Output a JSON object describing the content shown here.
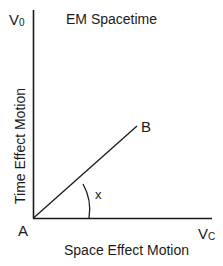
{
  "diagram": {
    "title": "EM Spacetime",
    "axes": {
      "y_end_label": "V",
      "y_end_subscript": "0",
      "x_end_label": "V",
      "x_end_subscript": "C",
      "y_axis_title": "Time Effect Motion",
      "x_axis_title": "Space Effect Motion"
    },
    "points": {
      "origin": "A",
      "end": "B"
    },
    "angle_label": "x",
    "colors": {
      "line": "#1a1a1a",
      "background": "#ffffff"
    }
  }
}
